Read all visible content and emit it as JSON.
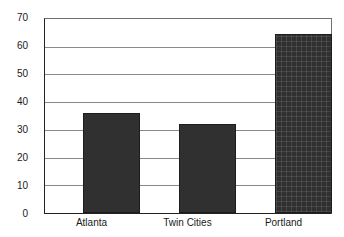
{
  "chart_data": {
    "type": "bar",
    "title": "",
    "subtitle": "",
    "xlabel": "",
    "ylabel": "",
    "categories": [
      "Atlanta",
      "Twin Cities",
      "Portland"
    ],
    "values": [
      36,
      32,
      64.5
    ],
    "series": [
      {
        "name": "",
        "values": [
          36,
          32,
          64.5
        ]
      }
    ],
    "ylim": [
      0,
      70
    ],
    "xlim": [
      0,
      3
    ],
    "y_ticks": [
      0,
      10,
      20,
      30,
      40,
      50,
      60,
      70
    ],
    "y_tick_labels": [
      "0",
      "10",
      "20",
      "30",
      "40",
      "50",
      "60",
      "70"
    ],
    "grid": true,
    "grid_axis": "y",
    "legend": false,
    "legend_position": "none",
    "annotations": [],
    "bar_color": "#303030",
    "grid_color": "#8a8a8a",
    "axis_color": "#222222",
    "background_color": "#ffffff",
    "bar_styles": [
      "solid",
      "solid",
      "textured"
    ]
  }
}
